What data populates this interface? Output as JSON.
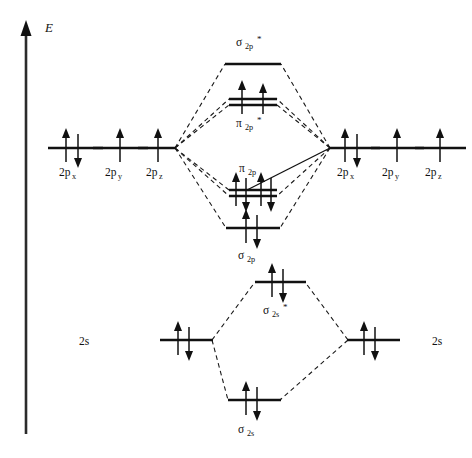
{
  "figure": {
    "type": "molecular-orbital-energy-diagram",
    "axis": {
      "label": "E",
      "meaning": "energy-increasing-upward",
      "orientation": "vertical-arrow-up"
    },
    "colors": {
      "line": "#111111",
      "dashed_correlation": "#1a1a1a",
      "background": "#ffffff"
    },
    "left_atom": {
      "levels": [
        {
          "id": "left-2px",
          "label": "2p",
          "sub": "x",
          "electrons": "up-down",
          "x": 75,
          "y": 148
        },
        {
          "id": "left-2py",
          "label": "2p",
          "sub": "y",
          "electrons": "up",
          "x": 120,
          "y": 148
        },
        {
          "id": "left-2pz",
          "label": "2p",
          "sub": "z",
          "electrons": "up",
          "x": 162,
          "y": 148
        },
        {
          "id": "left-2s",
          "label": "2s",
          "sub": "",
          "electrons": "up-down",
          "x": 185,
          "y": 340
        }
      ]
    },
    "right_atom": {
      "levels": [
        {
          "id": "right-2px",
          "label": "2p",
          "sub": "x",
          "electrons": "up-down",
          "x": 352,
          "y": 148
        },
        {
          "id": "right-2py",
          "label": "2p",
          "sub": "y",
          "electrons": "up",
          "x": 397,
          "y": 148
        },
        {
          "id": "right-2pz",
          "label": "2p",
          "sub": "z",
          "electrons": "up",
          "x": 440,
          "y": 148
        },
        {
          "id": "right-2s",
          "label": "2s",
          "sub": "",
          "electrons": "up-down",
          "x": 375,
          "y": 340
        }
      ]
    },
    "molecular_orbitals": [
      {
        "id": "sigma-2p-star",
        "label": "σ",
        "sub": "2p",
        "star": "*",
        "electrons": "empty",
        "x": 253,
        "y": 64,
        "label_pos": "above"
      },
      {
        "id": "pi-2p-star",
        "label": "π",
        "sub": "2p",
        "star": "*",
        "electrons": "up,up",
        "degenerate": 2,
        "x": 253,
        "y": 98,
        "label_pos": "below"
      },
      {
        "id": "pi-2p",
        "label": "π",
        "sub": "2p",
        "star": "",
        "electrons": "up-down,up-down",
        "degenerate": 2,
        "x": 253,
        "y": 190,
        "label_pos": "above"
      },
      {
        "id": "sigma-2p",
        "label": "σ",
        "sub": "2p",
        "star": "",
        "electrons": "up-down",
        "x": 253,
        "y": 228,
        "label_pos": "below"
      },
      {
        "id": "sigma-2s-star",
        "label": "σ",
        "sub": "2s",
        "star": "*",
        "electrons": "up-down",
        "x": 280,
        "y": 282,
        "label_pos": "below"
      },
      {
        "id": "sigma-2s",
        "label": "σ",
        "sub": "2s",
        "star": "",
        "electrons": "up-down",
        "x": 253,
        "y": 400,
        "label_pos": "below"
      }
    ]
  }
}
